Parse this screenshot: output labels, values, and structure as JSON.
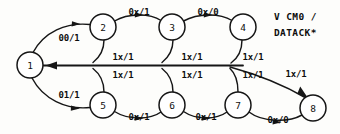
{
  "diagram": {
    "type": "state-transition-diagram",
    "background_color": "#fdfdfb",
    "line_color": "#161616",
    "nodes": [
      {
        "id": "1",
        "label": "1",
        "cx": 30,
        "cy": 65,
        "r": 13
      },
      {
        "id": "2",
        "label": "2",
        "cx": 103,
        "cy": 27,
        "r": 13
      },
      {
        "id": "3",
        "label": "3",
        "cx": 172,
        "cy": 27,
        "r": 13
      },
      {
        "id": "4",
        "label": "4",
        "cx": 243,
        "cy": 27,
        "r": 13
      },
      {
        "id": "5",
        "label": "5",
        "cx": 103,
        "cy": 105,
        "r": 13
      },
      {
        "id": "6",
        "label": "6",
        "cx": 172,
        "cy": 105,
        "r": 13
      },
      {
        "id": "7",
        "label": "7",
        "cx": 238,
        "cy": 105,
        "r": 13
      },
      {
        "id": "8",
        "label": "8",
        "cx": 313,
        "cy": 108,
        "r": 13
      }
    ],
    "edges": [
      {
        "from": "1",
        "to": "2",
        "label": "00/1",
        "label_x": 69,
        "label_y": 38
      },
      {
        "from": "1",
        "to": "5",
        "label": "01/1",
        "label_x": 69,
        "label_y": 95
      },
      {
        "from": "2",
        "to": "3",
        "label": "0x/1",
        "label_x": 139,
        "label_y": 12
      },
      {
        "from": "3",
        "to": "4",
        "label": "0x/0",
        "label_x": 208,
        "label_y": 12
      },
      {
        "from": "5",
        "to": "6",
        "label": "0x/1",
        "label_x": 139,
        "label_y": 117
      },
      {
        "from": "6",
        "to": "7",
        "label": "0x/1",
        "label_x": 206,
        "label_y": 117
      },
      {
        "from": "7",
        "to": "8",
        "label": "0x/0",
        "label_x": 278,
        "label_y": 120
      },
      {
        "from": "2",
        "to": "1",
        "label": "1x/1",
        "label_x": 123,
        "label_y": 57
      },
      {
        "from": "5",
        "to": "1",
        "label": "1x/1",
        "label_x": 123,
        "label_y": 75
      },
      {
        "from": "3",
        "to": "1",
        "label": "1x/1",
        "label_x": 192,
        "label_y": 57
      },
      {
        "from": "6",
        "to": "1",
        "label": "1x/1",
        "label_x": 192,
        "label_y": 75
      },
      {
        "from": "4",
        "to": "1",
        "label": "1x/1",
        "label_x": 253,
        "label_y": 57
      },
      {
        "from": "7",
        "to": "1",
        "label": "1x/1",
        "label_x": 253,
        "label_y": 75
      },
      {
        "from": "junction",
        "to": "8",
        "label": "1x/1",
        "label_x": 296,
        "label_y": 74
      }
    ],
    "annotation": {
      "line1": "V CM0 /",
      "line2": "DATACK*",
      "x": 274,
      "y1": 16,
      "y2": 32
    }
  }
}
